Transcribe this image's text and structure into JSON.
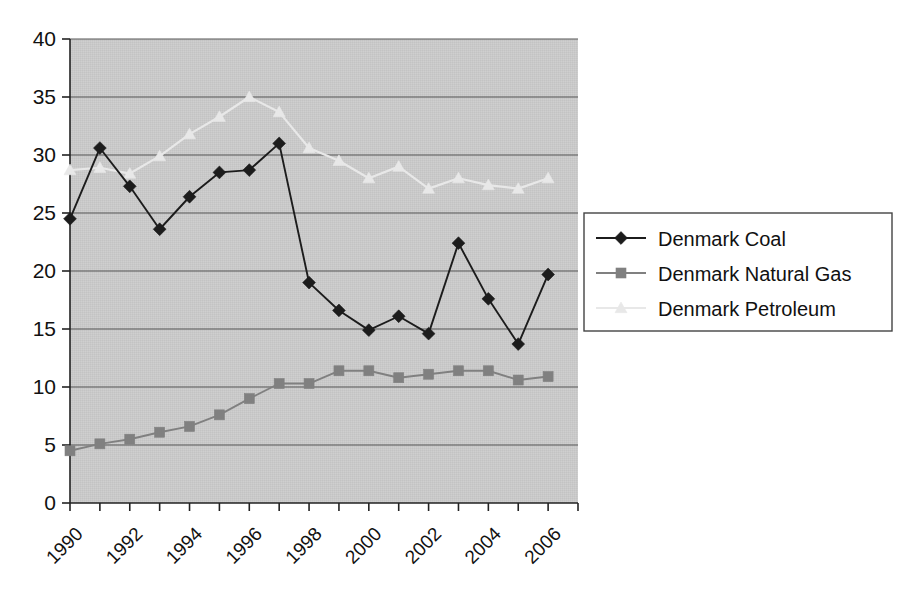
{
  "chart_data": {
    "type": "line",
    "title": "",
    "subtitle": "",
    "xlabel": "",
    "ylabel": "",
    "x": [
      1990,
      1991,
      1992,
      1993,
      1994,
      1995,
      1996,
      1997,
      1998,
      1999,
      2000,
      2001,
      2002,
      2003,
      2004,
      2005,
      2006,
      2007
    ],
    "categories": [
      "1990",
      "1991",
      "1992",
      "1993",
      "1994",
      "1995",
      "1996",
      "1997",
      "1998",
      "1999",
      "2000",
      "2001",
      "2002",
      "2003",
      "2004",
      "2005",
      "2006",
      "2007"
    ],
    "xtick_labels": [
      "1990",
      "1992",
      "1994",
      "1996",
      "1998",
      "2000",
      "2002",
      "2004",
      "2006"
    ],
    "xtick_values": [
      1990,
      1992,
      1994,
      1996,
      1998,
      2000,
      2002,
      2004,
      2006
    ],
    "ytick_labels": [
      "0",
      "5",
      "10",
      "15",
      "20",
      "25",
      "30",
      "35",
      "40"
    ],
    "ytick_values": [
      0,
      5,
      10,
      15,
      20,
      25,
      30,
      35,
      40
    ],
    "ylim": [
      0,
      40
    ],
    "xlim": [
      1990,
      2007
    ],
    "grid": "horizontal",
    "legend_position": "right",
    "plot_background": "#c9c9c9",
    "series": [
      {
        "name": "Denmark Coal",
        "color": "#1c1c1c",
        "marker": "diamond",
        "values": [
          24.5,
          30.6,
          27.3,
          23.6,
          26.4,
          28.5,
          28.7,
          31.0,
          19.0,
          16.6,
          14.9,
          16.1,
          14.6,
          22.4,
          17.6,
          13.7,
          19.7,
          null
        ]
      },
      {
        "name": "Denmark Natural Gas",
        "color": "#808080",
        "marker": "square",
        "values": [
          4.5,
          5.1,
          5.5,
          6.1,
          6.6,
          7.6,
          9.0,
          10.3,
          10.3,
          11.4,
          11.4,
          10.8,
          11.1,
          11.4,
          11.4,
          10.6,
          10.9,
          null
        ]
      },
      {
        "name": "Denmark Petroleum",
        "color": "#e8e8e8",
        "marker": "triangle",
        "values": [
          28.7,
          28.9,
          28.4,
          29.9,
          31.8,
          33.3,
          35.0,
          33.7,
          30.6,
          29.5,
          28.0,
          29.0,
          27.1,
          28.0,
          27.4,
          27.1,
          28.0,
          null
        ]
      }
    ]
  },
  "legend": {
    "entries": [
      {
        "label": "Denmark Coal"
      },
      {
        "label": "Denmark Natural Gas"
      },
      {
        "label": "Denmark Petroleum"
      }
    ]
  },
  "colors": {
    "coal": "#1c1c1c",
    "natural_gas": "#808080",
    "petroleum": "#e8e8e8",
    "plot_bg": "#c9c9c9",
    "gridline": "#555555",
    "axis": "#222222",
    "text": "#111111",
    "legend_border": "#444444",
    "page_bg": "#ffffff"
  }
}
